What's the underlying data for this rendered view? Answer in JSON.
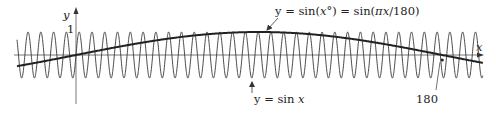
{
  "chart_data": {
    "type": "line",
    "title": "",
    "xlabel": "x",
    "ylabel": "y",
    "xlim": [
      -29,
      200
    ],
    "ylim": [
      -1,
      1
    ],
    "grid": false,
    "y_tick_labels": [
      "1"
    ],
    "x_tick_labels": [
      "180"
    ],
    "series": [
      {
        "name": "y = sin x",
        "function": "sin(x)",
        "x_units": "radians",
        "stroke": "thin"
      },
      {
        "name": "y = sin(x°) = sin(πx/180)",
        "function": "sin(pi*x/180)",
        "x_units": "degrees",
        "stroke": "thick"
      }
    ],
    "annotations": [
      {
        "text": "y = sin(x°) = sin(πx/180)",
        "points_to": "thick curve",
        "at_x": 94
      },
      {
        "text": "y = sin x",
        "points_to": "thin curve",
        "at_x": 87
      },
      {
        "text": "180",
        "points_to": "x-intercept of thick curve",
        "at_x": 180
      }
    ],
    "colors": {
      "curve": "#333333",
      "axis": "#555555",
      "background": "#ffffff"
    }
  },
  "labels": {
    "y_axis": "y",
    "x_axis": "x",
    "one": "1",
    "deg_prefix": "y = sin(",
    "deg_x": "x",
    "deg_mid": "°) = sin(",
    "deg_pi": "π",
    "deg_x2": "x",
    "deg_suffix": "/180)",
    "rad_prefix": "y = sin ",
    "rad_x": "x",
    "tick_180": "180"
  }
}
